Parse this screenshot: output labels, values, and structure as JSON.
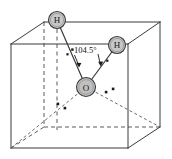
{
  "figure": {
    "background_color": "#ffffff",
    "width": 172,
    "height": 159
  },
  "cube": {
    "name": "reference-cube",
    "edge_color": "#3a3a3a",
    "hidden_edge_color": "#5a5a5a",
    "hidden_edge_style": "dashed",
    "front_face": {
      "top_left": [
        11,
        44
      ],
      "top_right": [
        128,
        44
      ],
      "bottom_right": [
        128,
        148
      ],
      "bottom_left": [
        11,
        148
      ]
    },
    "back_face": {
      "top_left": [
        44,
        22
      ],
      "top_right": [
        160,
        22
      ],
      "bottom_right": [
        160,
        127
      ],
      "bottom_left": [
        44,
        127
      ]
    }
  },
  "atoms": [
    {
      "id": "h1",
      "label": "H",
      "element": "hydrogen",
      "cx": 57,
      "cy": 20,
      "r": 8.5,
      "fill": "#c8c8c8",
      "stroke": "#3a3a3a"
    },
    {
      "id": "h2",
      "label": "H",
      "element": "hydrogen",
      "cx": 117,
      "cy": 45,
      "r": 8.5,
      "fill": "#c8c8c8",
      "stroke": "#3a3a3a"
    },
    {
      "id": "o1",
      "label": "O",
      "element": "oxygen",
      "cx": 86,
      "cy": 87,
      "r": 9.5,
      "fill": "#c8c8c8",
      "stroke": "#3a3a3a"
    }
  ],
  "bonds": [
    {
      "id": "bond-o-h1",
      "from": "o1",
      "to": "h1"
    },
    {
      "id": "bond-o-h2",
      "from": "o1",
      "to": "h2"
    }
  ],
  "lone_pairs": [
    {
      "id": "lone-pair-lower-left",
      "dots": [
        [
          58,
          104
        ],
        [
          65,
          108
        ]
      ]
    },
    {
      "id": "lone-pair-lower-right",
      "dots": [
        [
          106,
          92
        ],
        [
          113,
          89
        ]
      ]
    }
  ],
  "annotation": {
    "angle_label": "104.5°",
    "angle_label_x": 72,
    "angle_label_y": 51,
    "bond_angle_degrees": 104.5,
    "leader_arrows": [
      {
        "id": "arrow-to-left-bond",
        "from": [
          74,
          54
        ],
        "to": [
          79,
          66
        ]
      },
      {
        "id": "arrow-to-right-bond",
        "from": [
          98,
          54
        ],
        "to": [
          101,
          66
        ]
      }
    ],
    "tick_marks": [
      {
        "id": "tick-left",
        "x": 67,
        "y": 54
      },
      {
        "id": "tick-right",
        "x": 107,
        "y": 61
      }
    ]
  },
  "axis_guide": {
    "id": "vertical-dashed-axis",
    "from": [
      57,
      28
    ],
    "to": [
      57,
      130
    ],
    "style": "dashed"
  }
}
